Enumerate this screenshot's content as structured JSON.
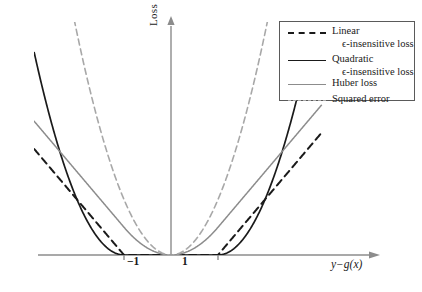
{
  "chart_data": {
    "type": "line",
    "title": "",
    "xlabel": "y−g(x)",
    "ylabel": "Loss",
    "xticks": [
      "−1",
      "1"
    ],
    "xtick_values": [
      -1,
      1
    ],
    "xlim": [
      -3.2,
      3.2
    ],
    "ylim": [
      0,
      4.2
    ],
    "grid": false,
    "epsilon": 1,
    "legend_position": "top-right",
    "axis_arrows": true,
    "series": [
      {
        "name": "Linear\nϵ-insensitive loss",
        "label_line1": "Linear",
        "label_line2": "ϵ-insensitive loss",
        "kind": "linear_eps",
        "color": "#1a1a1a",
        "dash": "7,5",
        "width": 2.0,
        "formula": "max(0, |r| - 1)",
        "points_x": [
          -3.2,
          -1,
          1,
          3.2
        ],
        "points_y": [
          2.2,
          0,
          0,
          2.2
        ]
      },
      {
        "name": "Quadratic\nϵ-insensitive loss",
        "label_line1": "Quadratic",
        "label_line2": "ϵ-insensitive loss",
        "kind": "quadratic_eps",
        "color": "#1a1a1a",
        "dash": "none",
        "width": 1.7,
        "formula": "max(0, |r| - 1)^2",
        "points_x": [
          -3.2,
          -2.5,
          -2,
          -1.5,
          -1,
          1,
          1.5,
          2,
          2.5,
          3.2
        ],
        "points_y": [
          4.84,
          2.25,
          1.0,
          0.25,
          0,
          0,
          0.25,
          1.0,
          2.25,
          4.84
        ]
      },
      {
        "name": "Huber loss",
        "label_line1": "Huber loss",
        "label_line2": "",
        "kind": "huber",
        "color": "#8c8c8c",
        "dash": "none",
        "width": 1.5,
        "formula": "r^2/2 if |r|<=1 else |r|-0.5",
        "points_x": [
          -3.2,
          -2,
          -1,
          0,
          1,
          2,
          3.2
        ],
        "points_y": [
          2.7,
          1.5,
          0.5,
          0,
          0.5,
          1.5,
          2.7
        ]
      },
      {
        "name": "Squared error",
        "label_line1": "Squared error",
        "label_line2": "",
        "kind": "squared",
        "color": "#a8a8a8",
        "dash": "6,4",
        "width": 1.6,
        "formula": "r^2",
        "points_x": [
          -2.1,
          -1.5,
          -1,
          -0.5,
          0,
          0.5,
          1,
          1.5,
          2.1
        ],
        "points_y": [
          4.41,
          2.25,
          1.0,
          0.25,
          0,
          0.25,
          1.0,
          2.25,
          4.41
        ]
      }
    ]
  },
  "axes": {
    "x_axis_color": "#8c8c8c",
    "y_axis_color": "#8c8c8c",
    "tick_color": "#8c8c8c"
  },
  "legend": {
    "border_color": "#5a5a5a",
    "background": "#ffffff",
    "entries": [
      {
        "label_line1": "Linear",
        "label_line2": "ϵ-insensitive loss"
      },
      {
        "label_line1": "Quadratic",
        "label_line2": "ϵ-insensitive loss"
      },
      {
        "label_line1": "Huber loss",
        "label_line2": ""
      },
      {
        "label_line1": "Squared error",
        "label_line2": ""
      }
    ]
  }
}
